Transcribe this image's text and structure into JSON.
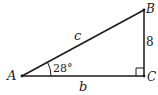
{
  "diagram": {
    "type": "right-triangle",
    "vertices": {
      "A": {
        "label": "A"
      },
      "B": {
        "label": "B"
      },
      "C": {
        "label": "C"
      }
    },
    "sides": {
      "c": {
        "label": "c",
        "between": "A-B"
      },
      "b": {
        "label": "b",
        "between": "A-C"
      },
      "BC": {
        "label": "8",
        "between": "B-C"
      }
    },
    "angle_A": {
      "label": "28°"
    },
    "right_angle_at": "C",
    "colors": {
      "stroke": "#1a1a1a",
      "background": "#ffffff"
    }
  }
}
